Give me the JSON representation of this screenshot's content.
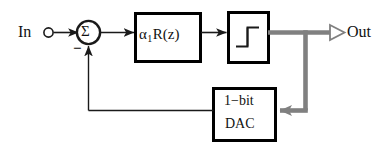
{
  "diagram": {
    "type": "signal-flow-block-diagram",
    "colors": {
      "line": "#1a1a1a",
      "block_border": "#000000",
      "block_fill": "#ffffff",
      "feedback_path": "#808080",
      "background": "#ffffff",
      "text": "#111111"
    },
    "nodes": {
      "input": {
        "label": "In",
        "terminal": "hollow-circle"
      },
      "summer": {
        "label": "Σ",
        "negative_sign": "−",
        "shape": "circle"
      },
      "gain_filter": {
        "alpha": "α",
        "subscript": "1",
        "transfer": "R(z)",
        "full_label": "α1R(z)"
      },
      "quantizer": {
        "symbol": "staircase-step",
        "label": ""
      },
      "output": {
        "label": "Out",
        "terminal": "hollow-arrow-flag"
      },
      "dac": {
        "line1": "1−bit",
        "line2": "DAC"
      }
    },
    "edges": [
      {
        "from": "input",
        "to": "summer",
        "style": "solid"
      },
      {
        "from": "summer",
        "to": "gain_filter",
        "style": "solid"
      },
      {
        "from": "gain_filter",
        "to": "quantizer",
        "style": "solid"
      },
      {
        "from": "quantizer",
        "to": "output",
        "style": "gray-thick"
      },
      {
        "from": "quantizer",
        "to": "dac",
        "style": "gray-thick"
      },
      {
        "from": "dac",
        "to": "summer",
        "style": "solid"
      }
    ]
  }
}
